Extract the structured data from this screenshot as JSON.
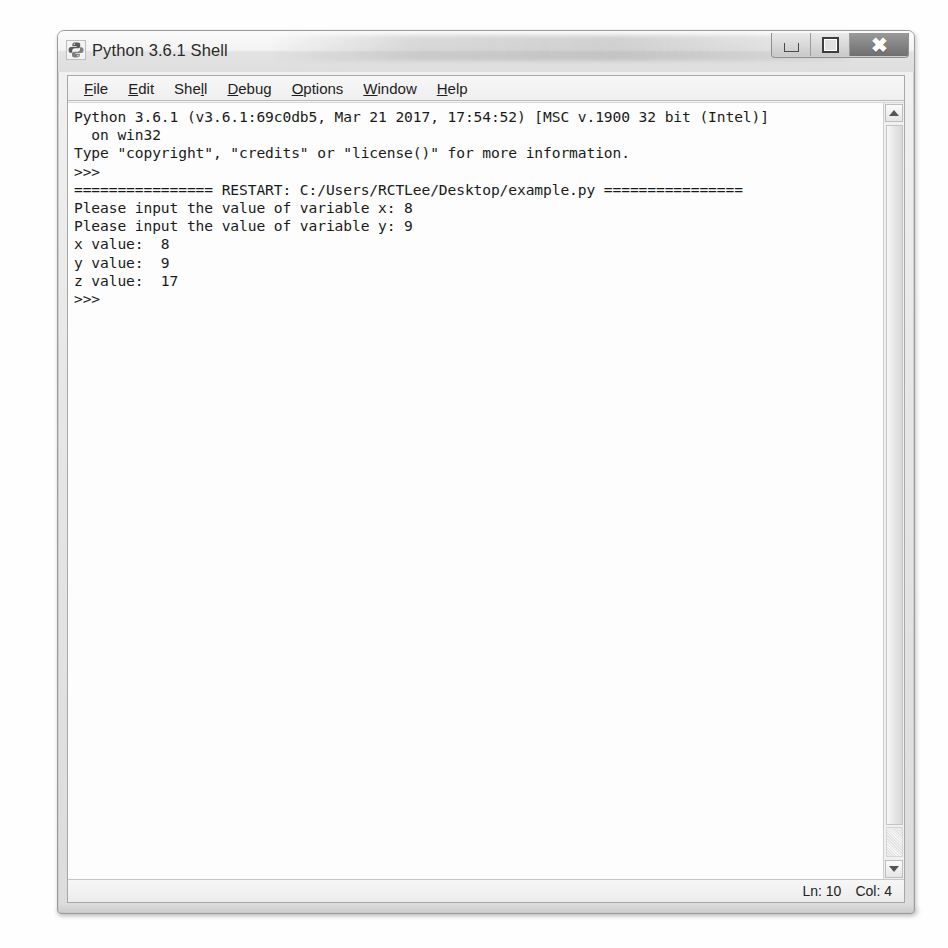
{
  "window": {
    "title": "Python 3.6.1 Shell",
    "icon": "python-logo-icon",
    "controls": {
      "minimize_label": "–",
      "maximize_label": "□",
      "close_label": "×"
    }
  },
  "menubar": {
    "items": [
      {
        "label": "File",
        "accel": "F"
      },
      {
        "label": "Edit",
        "accel": "E"
      },
      {
        "label": "Shell",
        "accel": "l"
      },
      {
        "label": "Debug",
        "accel": "D"
      },
      {
        "label": "Options",
        "accel": "O"
      },
      {
        "label": "Window",
        "accel": "W"
      },
      {
        "label": "Help",
        "accel": "H"
      }
    ]
  },
  "console": {
    "lines": [
      "Python 3.6.1 (v3.6.1:69c0db5, Mar 21 2017, 17:54:52) [MSC v.1900 32 bit (Intel)]",
      "  on win32",
      "Type \"copyright\", \"credits\" or \"license()\" for more information.",
      ">>> ",
      "================ RESTART: C:/Users/RCTLee/Desktop/example.py ================",
      "Please input the value of variable x: 8",
      "Please input the value of variable y: 9",
      "x value:  8",
      "y value:  9",
      "z value:  17",
      ">>> "
    ]
  },
  "scrollbar": {
    "up_arrow": "scroll-up-arrow-icon",
    "down_arrow": "scroll-down-arrow-icon"
  },
  "statusbar": {
    "line_label": "Ln: 10",
    "col_label": "Col: 4"
  },
  "colors": {
    "window_frame": "#9b9b9b",
    "titlebar": "#f3f3f3",
    "client_bg": "#fdfdfd",
    "text": "#1a1a1a",
    "close_button": "#8a8a8a"
  }
}
